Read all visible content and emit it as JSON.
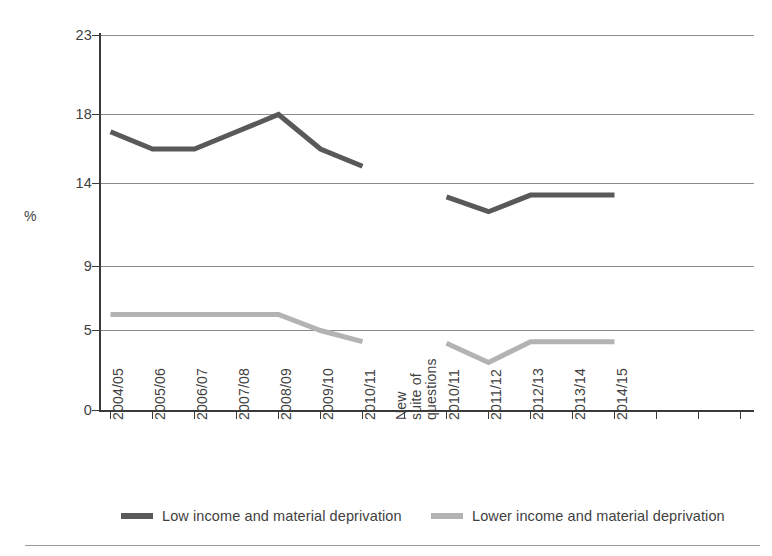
{
  "chart_data": {
    "type": "line",
    "title": "",
    "subtitle": "",
    "xlabel": "",
    "ylabel": "%",
    "ylim": [
      0,
      23
    ],
    "yticks": [
      0,
      5,
      9,
      14,
      18,
      23
    ],
    "ytick_labels": [
      "0",
      "5",
      "9",
      "14",
      "18",
      "23"
    ],
    "grid": "horizontal",
    "legend_position": "bottom",
    "categories": [
      "2004/05",
      "2005/06",
      "2006/07",
      "2007/08",
      "2008/09",
      "2009/10",
      "2010/11",
      "New suite of questions",
      "2010/11",
      "2011/12",
      "2012/13",
      "2013/14",
      "2014/15"
    ],
    "break_index": 7,
    "break_label_lines": [
      "New",
      "suite of",
      "questions"
    ],
    "series": [
      {
        "name": "Low income and material deprivation",
        "color": "#595959",
        "segments": [
          {
            "categories": [
              "2004/05",
              "2005/06",
              "2006/07",
              "2007/08",
              "2008/09",
              "2009/10",
              "2010/11"
            ],
            "values": [
              17.0,
              16.0,
              16.0,
              17.0,
              18.0,
              16.0,
              15.0
            ]
          },
          {
            "categories": [
              "2010/11",
              "2011/12",
              "2012/13",
              "2013/14",
              "2014/15"
            ],
            "values": [
              13.2,
              12.3,
              13.3,
              13.3,
              13.3
            ]
          }
        ]
      },
      {
        "name": "Lower income and material deprivation",
        "color": "#b3b3b3",
        "segments": [
          {
            "categories": [
              "2004/05",
              "2005/06",
              "2006/07",
              "2007/08",
              "2008/09",
              "2009/10",
              "2010/11"
            ],
            "values": [
              6.0,
              6.0,
              6.0,
              6.0,
              6.0,
              5.0,
              4.3
            ]
          },
          {
            "categories": [
              "2010/11",
              "2011/12",
              "2012/13",
              "2013/14",
              "2014/15"
            ],
            "values": [
              4.2,
              3.0,
              4.3,
              4.3,
              4.3
            ]
          }
        ]
      }
    ]
  },
  "axis": {
    "ylabel": "%",
    "ytick_labels": [
      "23",
      "18",
      "14",
      "9",
      "5",
      "0"
    ],
    "xtick_labels": [
      "2004/05",
      "2005/06",
      "2006/07",
      "2007/08",
      "2008/09",
      "2009/10",
      "2010/11",
      "2010/11",
      "2011/12",
      "2012/13",
      "2013/14",
      "2014/15"
    ],
    "break_lines": [
      "New",
      "suite of",
      "questions"
    ]
  },
  "legend": {
    "items": [
      {
        "label": "Low income and material deprivation",
        "color": "#595959"
      },
      {
        "label": "Lower income and material deprivation",
        "color": "#b3b3b3"
      }
    ]
  },
  "colors": {
    "series_dark": "#595959",
    "series_light": "#b3b3b3",
    "grid": "#8c8c8c",
    "axis": "#3a3a3a",
    "text": "#3f3f3f",
    "rule": "#9a9a9a"
  }
}
